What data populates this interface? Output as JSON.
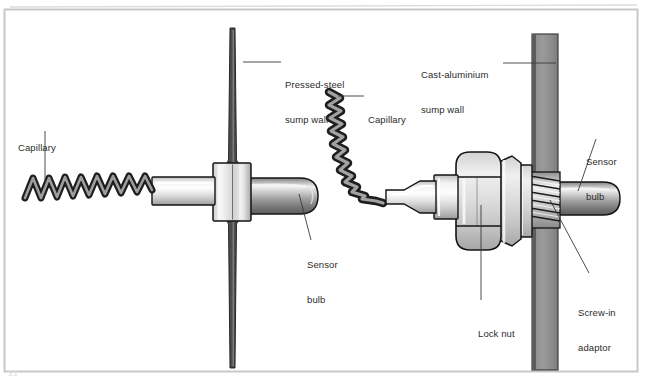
{
  "figure": {
    "border_color": "#c8c8c8",
    "background": "#ffffff",
    "width": 645,
    "height": 382,
    "page_marker": "3.1"
  },
  "colors": {
    "outline": "#1a1a1a",
    "metal_light": "#f2f2f2",
    "metal_mid": "#b9b9b9",
    "metal_dark": "#6e6e6e",
    "wall_steel": "#4d4d4d",
    "wall_alu": "#8c8c8c",
    "wall_alu_edge": "#575757",
    "leader_line": "#3a3a3a",
    "text": "#2b2b2b"
  },
  "labels": [
    {
      "id": "capillary-left",
      "text": "Capillary",
      "line1": "Capillary",
      "line2": "",
      "x": 18,
      "y": 119,
      "align": "left"
    },
    {
      "id": "pressed-steel-sump-wall",
      "text": "Pressed-steel sump wall",
      "line1": "Pressed-steel",
      "line2": "sump wall",
      "x": 285,
      "y": 56,
      "align": "left"
    },
    {
      "id": "capillary-middle",
      "text": "Capillary",
      "line1": "Capillary",
      "line2": "",
      "x": 368,
      "y": 91,
      "align": "left"
    },
    {
      "id": "cast-aluminium-sump-wall",
      "text": "Cast-aluminium sump wall",
      "line1": "Cast-aluminium",
      "line2": "sump wall",
      "x": 421,
      "y": 46,
      "align": "left"
    },
    {
      "id": "sensor-bulb-right",
      "text": "Sensor bulb",
      "line1": "Sensor",
      "line2": "bulb",
      "x": 586,
      "y": 133,
      "align": "left"
    },
    {
      "id": "sensor-bulb-left",
      "text": "Sensor bulb",
      "line1": "Sensor",
      "line2": "bulb",
      "x": 307,
      "y": 236,
      "align": "left"
    },
    {
      "id": "screw-in-adaptor",
      "text": "Screw-in adaptor",
      "line1": "Screw-in",
      "line2": "adaptor",
      "x": 578,
      "y": 284,
      "align": "left"
    },
    {
      "id": "lock-nut",
      "text": "Lock nut",
      "line1": "Lock nut",
      "line2": "",
      "x": 478,
      "y": 305,
      "align": "left"
    }
  ],
  "assemblies": {
    "left": {
      "name": "Pressed-steel sump wall installation",
      "parts": [
        "capillary",
        "stem",
        "collar-boss",
        "sensor-bulb",
        "pressed-steel-wall"
      ]
    },
    "right": {
      "name": "Cast-aluminium sump wall installation",
      "parts": [
        "capillary-coil",
        "tapered-stem",
        "lock-nut",
        "hex-adaptor",
        "screw-thread",
        "sensor-bulb",
        "cast-aluminium-wall"
      ]
    }
  }
}
